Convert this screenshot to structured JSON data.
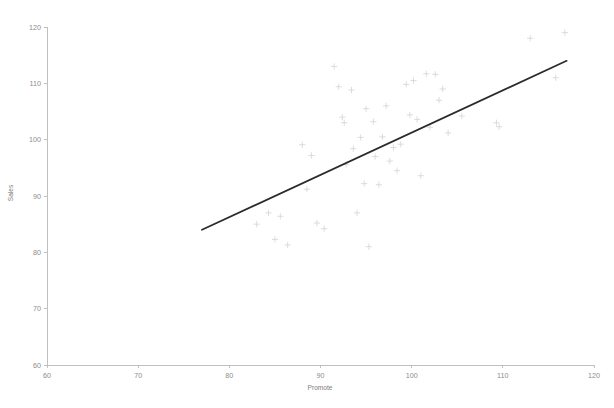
{
  "chart_data": {
    "type": "scatter",
    "title": "",
    "xlabel": "Promote",
    "ylabel": "Sales",
    "xlim": [
      60,
      120
    ],
    "ylim": [
      60,
      120
    ],
    "xticks": [
      60,
      70,
      80,
      90,
      100,
      110,
      120
    ],
    "yticks": [
      60,
      70,
      80,
      90,
      100,
      110,
      120
    ],
    "grid": false,
    "legend": null,
    "marker": "plus",
    "marker_color": "#d6d6d6",
    "line_color": "#2b2b2b",
    "axis_color": "#b9b9b9",
    "points": [
      {
        "x": 83.0,
        "y": 85.0
      },
      {
        "x": 84.3,
        "y": 87.0
      },
      {
        "x": 85.0,
        "y": 82.3
      },
      {
        "x": 85.6,
        "y": 86.4
      },
      {
        "x": 86.4,
        "y": 81.3
      },
      {
        "x": 88.0,
        "y": 99.1
      },
      {
        "x": 88.5,
        "y": 91.2
      },
      {
        "x": 89.0,
        "y": 97.2
      },
      {
        "x": 89.6,
        "y": 85.2
      },
      {
        "x": 90.4,
        "y": 84.2
      },
      {
        "x": 91.5,
        "y": 113.0
      },
      {
        "x": 92.0,
        "y": 109.4
      },
      {
        "x": 92.4,
        "y": 104.0
      },
      {
        "x": 92.6,
        "y": 103.0
      },
      {
        "x": 92.8,
        "y": 95.6
      },
      {
        "x": 93.4,
        "y": 108.8
      },
      {
        "x": 93.6,
        "y": 98.4
      },
      {
        "x": 94.0,
        "y": 87.0
      },
      {
        "x": 94.4,
        "y": 100.4
      },
      {
        "x": 94.8,
        "y": 92.2
      },
      {
        "x": 95.0,
        "y": 105.5
      },
      {
        "x": 95.3,
        "y": 81.0
      },
      {
        "x": 95.8,
        "y": 103.2
      },
      {
        "x": 96.0,
        "y": 97.0
      },
      {
        "x": 96.4,
        "y": 92.0
      },
      {
        "x": 96.8,
        "y": 100.5
      },
      {
        "x": 97.2,
        "y": 106.0
      },
      {
        "x": 97.6,
        "y": 96.2
      },
      {
        "x": 98.0,
        "y": 98.6
      },
      {
        "x": 98.4,
        "y": 94.5
      },
      {
        "x": 98.8,
        "y": 99.2
      },
      {
        "x": 99.4,
        "y": 109.8
      },
      {
        "x": 99.8,
        "y": 104.4
      },
      {
        "x": 100.2,
        "y": 110.5
      },
      {
        "x": 100.6,
        "y": 103.6
      },
      {
        "x": 101.0,
        "y": 93.6
      },
      {
        "x": 101.6,
        "y": 111.7
      },
      {
        "x": 102.0,
        "y": 102.2
      },
      {
        "x": 102.6,
        "y": 111.6
      },
      {
        "x": 103.0,
        "y": 107.0
      },
      {
        "x": 103.4,
        "y": 109.0
      },
      {
        "x": 104.0,
        "y": 101.2
      },
      {
        "x": 105.5,
        "y": 104.2
      },
      {
        "x": 109.3,
        "y": 103.0
      },
      {
        "x": 109.6,
        "y": 102.3
      },
      {
        "x": 113.0,
        "y": 118.0
      },
      {
        "x": 115.8,
        "y": 111.0
      },
      {
        "x": 116.8,
        "y": 119.0
      }
    ],
    "fit_line": {
      "x1": 77.0,
      "y1": 84.0,
      "x2": 117.0,
      "y2": 114.0
    }
  },
  "axes": {
    "y_title": "Sales",
    "x_title": "Promote"
  }
}
